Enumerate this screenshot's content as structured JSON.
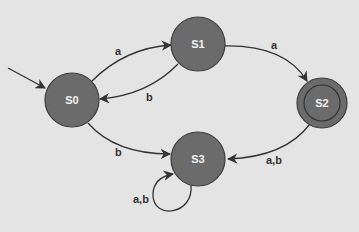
{
  "diagram": {
    "type": "finite-state-automaton",
    "colors": {
      "background": "#e4e4e4",
      "state_fill": "#6b6b6b",
      "state_stroke": "#3e3e3e",
      "edge": "#333333",
      "state_text": "#f2f2f2"
    },
    "start_state": "S0",
    "states": [
      {
        "id": "S0",
        "label": "S0",
        "accepting": false
      },
      {
        "id": "S1",
        "label": "S1",
        "accepting": false
      },
      {
        "id": "S2",
        "label": "S2",
        "accepting": true
      },
      {
        "id": "S3",
        "label": "S3",
        "accepting": false
      }
    ],
    "transitions": [
      {
        "from": "S0",
        "to": "S1",
        "label": "a"
      },
      {
        "from": "S1",
        "to": "S0",
        "label": "b"
      },
      {
        "from": "S1",
        "to": "S2",
        "label": "a"
      },
      {
        "from": "S0",
        "to": "S3",
        "label": "b"
      },
      {
        "from": "S2",
        "to": "S3",
        "label": "a,b"
      },
      {
        "from": "S3",
        "to": "S3",
        "label": "a,b"
      }
    ]
  }
}
